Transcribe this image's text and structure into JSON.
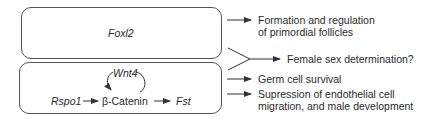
{
  "diagram": {
    "boxes": {
      "top": {
        "label": "Foxl2"
      },
      "bottom": {
        "nodes": {
          "rspo1": "Rspo1",
          "beta_catenin": "β-Catenin",
          "fst": "Fst",
          "wnt4": "Wnt4"
        }
      }
    },
    "outcomes": [
      {
        "id": "follicles",
        "line1": "Formation and regulation",
        "line2": "of primordial follicles"
      },
      {
        "id": "sex-determination",
        "line1": "Female sex determination?"
      },
      {
        "id": "germ-cell",
        "line1": "Germ cell survival"
      },
      {
        "id": "suppression",
        "line1": "Supression of endothelial cell",
        "line2": "migration, and male development"
      }
    ],
    "colors": {
      "line": "#333333",
      "box_border": "#555555",
      "text": "#2a2a2a"
    }
  }
}
